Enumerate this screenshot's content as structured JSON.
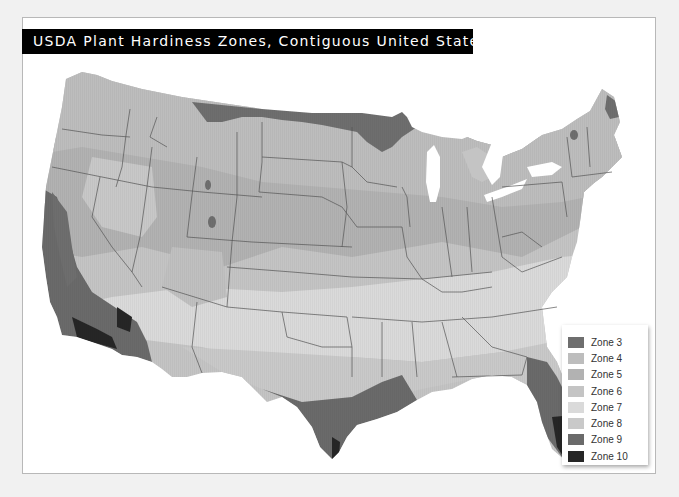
{
  "title": "USDA Plant Hardiness Zones, Contiguous United States, 2012",
  "legend": {
    "items": [
      {
        "label": "Zone 3",
        "color": "#6e6e6e"
      },
      {
        "label": "Zone 4",
        "color": "#bdbdbd"
      },
      {
        "label": "Zone 5",
        "color": "#b2b2b2"
      },
      {
        "label": "Zone 6",
        "color": "#c4c4c4"
      },
      {
        "label": "Zone 7",
        "color": "#dadada"
      },
      {
        "label": "Zone 8",
        "color": "#c9c9c9"
      },
      {
        "label": "Zone 9",
        "color": "#6a6a6a"
      },
      {
        "label": "Zone 10",
        "color": "#262626"
      }
    ]
  },
  "map": {
    "region": "Contiguous United States",
    "year": "2012",
    "border_color": "#555555"
  }
}
